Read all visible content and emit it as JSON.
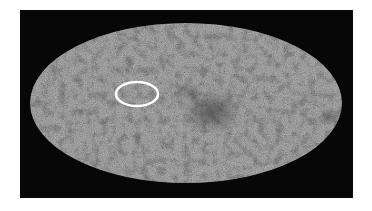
{
  "image": {
    "description": "All-sky cosmic microwave background map in Mollweide (oval) projection with a highlighted circled region",
    "colors": {
      "page_background": "#ffffff",
      "frame_background": "#070707",
      "sky_base": "#7c7c7c",
      "sky_dark_patch": "#3a3a3a",
      "highlight_ring": "#ffffff"
    },
    "sky_map": {
      "cx": 186,
      "cy": 103,
      "rx": 156,
      "ry": 80
    },
    "highlight": {
      "cx": 137,
      "cy": 94,
      "rx": 21,
      "ry": 12,
      "stroke_width": 2.5
    }
  }
}
